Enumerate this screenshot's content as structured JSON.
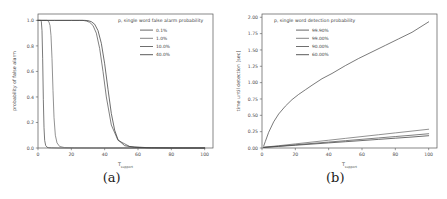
{
  "figure": {
    "subfigures": [
      {
        "caption": "(a)",
        "chart_data": {
          "type": "line",
          "title": "",
          "xlabel": "T",
          "xlabel_sub": "support",
          "ylabel": "probability of false alarm",
          "xlim": [
            0,
            105
          ],
          "ylim": [
            0.0,
            1.05
          ],
          "xticks": [
            0,
            20,
            40,
            60,
            80,
            100
          ],
          "xticklabels": [
            "0",
            "20",
            "40",
            "60",
            "80",
            "100"
          ],
          "yticks": [
            0.0,
            0.2,
            0.4,
            0.6,
            0.8,
            1.0
          ],
          "yticklabels": [
            "0.0",
            "0.2",
            "0.4",
            "0.6",
            "0.8",
            "1.0"
          ],
          "grid": false,
          "legend_position": "upper right",
          "legend_title": "p, single word false alarm probability",
          "series": [
            {
              "name": "0.1%",
              "color": "#4d4d4d",
              "x": [
                0,
                1,
                1.6,
                2.0,
                2.4,
                2.8,
                3.2,
                3.6,
                4.0,
                4.6,
                5.4,
                6.5,
                8,
                12,
                20,
                40,
                70,
                100
              ],
              "values": [
                1.0,
                1.0,
                1.0,
                0.99,
                0.92,
                0.7,
                0.38,
                0.16,
                0.06,
                0.02,
                0.006,
                0.002,
                0.001,
                0.0,
                0.0,
                0.0,
                0.0,
                0.0
              ]
            },
            {
              "name": "1.0%",
              "color": "#6e6e6e",
              "x": [
                0,
                2,
                4,
                5.5,
                6.5,
                7.2,
                7.8,
                8.4,
                9.0,
                9.6,
                10.4,
                11.4,
                13,
                16,
                22,
                35,
                60,
                100
              ],
              "values": [
                1.0,
                1.0,
                1.0,
                1.0,
                0.99,
                0.96,
                0.88,
                0.7,
                0.45,
                0.24,
                0.1,
                0.04,
                0.012,
                0.003,
                0.001,
                0.0,
                0.0,
                0.0
              ]
            },
            {
              "name": "10.0%",
              "color": "#555555",
              "x": [
                0,
                5,
                10,
                15,
                20,
                24,
                27,
                29,
                31,
                33,
                35,
                37,
                39,
                41,
                44,
                48,
                55,
                65,
                80,
                100
              ],
              "values": [
                1.0,
                1.0,
                1.0,
                1.0,
                1.0,
                1.0,
                1.0,
                0.995,
                0.985,
                0.96,
                0.9,
                0.78,
                0.6,
                0.4,
                0.18,
                0.06,
                0.012,
                0.003,
                0.001,
                0.0
              ]
            },
            {
              "name": "40.0%",
              "color": "#3d3d3d",
              "x": [
                0,
                5,
                10,
                15,
                20,
                25,
                28,
                30,
                32,
                34,
                36,
                38,
                40,
                42,
                44,
                46,
                48,
                52,
                58,
                68,
                82,
                100
              ],
              "values": [
                1.0,
                1.0,
                1.0,
                1.0,
                1.0,
                1.0,
                1.0,
                0.998,
                0.99,
                0.97,
                0.92,
                0.82,
                0.66,
                0.46,
                0.27,
                0.14,
                0.065,
                0.018,
                0.005,
                0.001,
                0.0,
                0.0
              ]
            }
          ]
        }
      },
      {
        "caption": "(b)",
        "chart_data": {
          "type": "line",
          "title": "",
          "xlabel": "T",
          "xlabel_sub": "support",
          "ylabel": "time until detection [sec]",
          "xlim": [
            0,
            105
          ],
          "ylim": [
            0.0,
            2.05
          ],
          "xticks": [
            0,
            20,
            40,
            60,
            80,
            100
          ],
          "xticklabels": [
            "0",
            "20",
            "40",
            "60",
            "80",
            "100"
          ],
          "yticks": [
            0.0,
            0.25,
            0.5,
            0.75,
            1.0,
            1.25,
            1.5,
            1.75,
            2.0
          ],
          "yticklabels": [
            "0.00",
            "0.25",
            "0.50",
            "0.75",
            "1.00",
            "1.25",
            "1.50",
            "1.75",
            "2.00"
          ],
          "grid": false,
          "legend_position": "upper left",
          "legend_title": "p, single word detection probability",
          "series": [
            {
              "name": "99.90%",
              "color": "#4d4d4d",
              "x": [
                1,
                2,
                4,
                7,
                10,
                14,
                18,
                22,
                26,
                30,
                36,
                42,
                50,
                58,
                66,
                74,
                82,
                90,
                100
              ],
              "values": [
                0.03,
                0.1,
                0.24,
                0.4,
                0.52,
                0.64,
                0.74,
                0.82,
                0.89,
                0.96,
                1.06,
                1.14,
                1.26,
                1.37,
                1.47,
                1.57,
                1.67,
                1.77,
                1.93
              ]
            },
            {
              "name": "99.00%",
              "color": "#6e6e6e",
              "x": [
                1,
                10,
                20,
                30,
                40,
                50,
                60,
                70,
                80,
                90,
                100
              ],
              "values": [
                0.012,
                0.035,
                0.063,
                0.091,
                0.119,
                0.147,
                0.175,
                0.203,
                0.231,
                0.259,
                0.287
              ]
            },
            {
              "name": "90.00%",
              "color": "#555555",
              "x": [
                1,
                10,
                20,
                30,
                40,
                50,
                60,
                70,
                80,
                90,
                100
              ],
              "values": [
                0.01,
                0.028,
                0.049,
                0.07,
                0.091,
                0.112,
                0.133,
                0.154,
                0.175,
                0.196,
                0.218
              ]
            },
            {
              "name": "60.00%",
              "color": "#3d3d3d",
              "x": [
                1,
                10,
                20,
                30,
                40,
                50,
                60,
                70,
                80,
                90,
                100
              ],
              "values": [
                0.008,
                0.024,
                0.042,
                0.06,
                0.078,
                0.096,
                0.114,
                0.132,
                0.15,
                0.168,
                0.188
              ]
            }
          ]
        }
      }
    ]
  }
}
